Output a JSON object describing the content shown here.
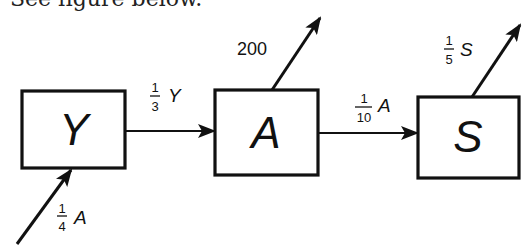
{
  "caption": "See figure below.",
  "diagram": {
    "nodes": [
      {
        "id": "Y",
        "label": "Y"
      },
      {
        "id": "A",
        "label": "A"
      },
      {
        "id": "S",
        "label": "S"
      }
    ],
    "edges": [
      {
        "from": "external",
        "to": "Y",
        "frac_num": "1",
        "frac_den": "4",
        "var": "A"
      },
      {
        "from": "Y",
        "to": "A",
        "frac_num": "1",
        "frac_den": "3",
        "var": "Y"
      },
      {
        "from": "A",
        "to": "external",
        "value": "200"
      },
      {
        "from": "A",
        "to": "S",
        "frac_num": "1",
        "frac_den": "10",
        "var": "A"
      },
      {
        "from": "S",
        "to": "external",
        "frac_num": "1",
        "frac_den": "5",
        "var": "S"
      }
    ]
  }
}
